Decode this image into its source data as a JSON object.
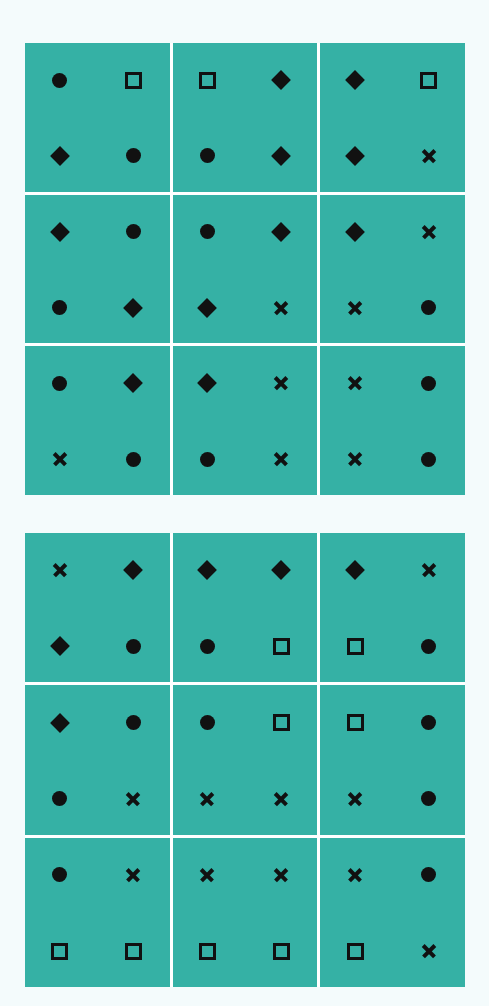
{
  "colors": {
    "background": "#f4fbfc",
    "cell": "#35b1a5",
    "gap": "#ffffff",
    "symbol": "#111111"
  },
  "grids": [
    {
      "name": "top-grid",
      "cells": [
        [
          "circle",
          "square",
          "diamond",
          "circle"
        ],
        [
          "square",
          "diamond",
          "circle",
          "diamond"
        ],
        [
          "diamond",
          "square",
          "diamond",
          "cross"
        ],
        [
          "diamond",
          "circle",
          "circle",
          "diamond"
        ],
        [
          "circle",
          "diamond",
          "diamond",
          "cross"
        ],
        [
          "diamond",
          "cross",
          "cross",
          "circle"
        ],
        [
          "circle",
          "diamond",
          "cross",
          "circle"
        ],
        [
          "diamond",
          "cross",
          "circle",
          "cross"
        ],
        [
          "cross",
          "circle",
          "cross",
          "circle"
        ]
      ]
    },
    {
      "name": "bottom-grid",
      "cells": [
        [
          "cross",
          "diamond",
          "diamond",
          "circle"
        ],
        [
          "diamond",
          "diamond",
          "circle",
          "square"
        ],
        [
          "diamond",
          "cross",
          "square",
          "circle"
        ],
        [
          "diamond",
          "circle",
          "circle",
          "cross"
        ],
        [
          "circle",
          "square",
          "cross",
          "cross"
        ],
        [
          "square",
          "circle",
          "cross",
          "circle"
        ],
        [
          "circle",
          "cross",
          "square",
          "square"
        ],
        [
          "cross",
          "cross",
          "square",
          "square"
        ],
        [
          "cross",
          "circle",
          "square",
          "cross"
        ]
      ]
    }
  ]
}
